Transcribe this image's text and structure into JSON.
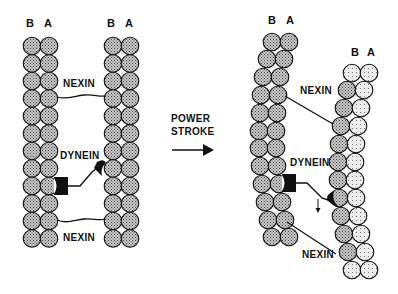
{
  "diagram": {
    "before_panel": {
      "left_doublet_labels": {
        "b": "B",
        "a": "A"
      },
      "right_doublet_labels": {
        "b": "B",
        "a": "A"
      },
      "nexin_top": "NEXIN",
      "dynein": "DYNEIN",
      "nexin_bottom": "NEXIN"
    },
    "transition": {
      "line1": "POWER",
      "line2": "STROKE",
      "arrow": "right-arrow"
    },
    "after_panel": {
      "left_doublet_labels": {
        "b": "B",
        "a": "A"
      },
      "right_doublet_labels": {
        "b": "B",
        "a": "A"
      },
      "nexin_top": "NEXIN",
      "dynein": "DYNEIN",
      "nexin_bottom": "NEXIN",
      "displacement_arrow": "down-arrow"
    },
    "colors": {
      "subunit_fill": "#9a9a9a",
      "subunit_light_fill": "#e0e0e0",
      "outline": "#111111",
      "background": "#ffffff"
    }
  }
}
